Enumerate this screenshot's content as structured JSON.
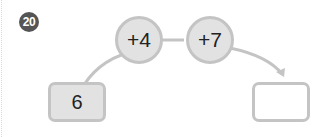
{
  "problem": {
    "number": "20",
    "start_value": "6",
    "operations": [
      "+4",
      "+7"
    ],
    "answer_value": ""
  },
  "colors": {
    "badge": "#555555",
    "fill": "#e2e2e2",
    "stroke": "#c4c4c4"
  }
}
